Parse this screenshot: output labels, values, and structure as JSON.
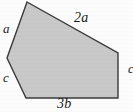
{
  "figure": {
    "type": "polygon-diagram",
    "shape_name": "pentagon",
    "fill_color": "#c9c9c9",
    "stroke_color": "#3a3a3a",
    "background_color": "#fdfdfd",
    "vertices": [
      {
        "name": "top",
        "x": 27,
        "y": 2
      },
      {
        "name": "right",
        "x": 118,
        "y": 53
      },
      {
        "name": "bottom-right",
        "x": 118,
        "y": 98
      },
      {
        "name": "bottom-left",
        "x": 26,
        "y": 98
      },
      {
        "name": "left",
        "x": 7,
        "y": 58
      }
    ],
    "labels": [
      {
        "id": "a",
        "text": "a",
        "side": "upper-left"
      },
      {
        "id": "2a",
        "text": "2a",
        "side": "top-right"
      },
      {
        "id": "c_left",
        "text": "c",
        "side": "lower-left"
      },
      {
        "id": "3b",
        "text": "3b",
        "side": "bottom"
      },
      {
        "id": "c_right",
        "text": "c",
        "side": "right-clipped"
      }
    ]
  }
}
